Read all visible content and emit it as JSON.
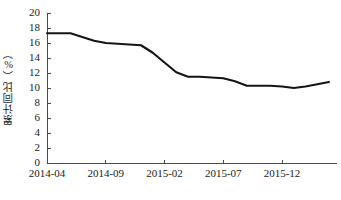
{
  "chart_data": {
    "type": "line",
    "title": "",
    "subtitle": "",
    "xlabel": "",
    "ylabel": "累计同比（%）",
    "ylim": [
      0,
      20
    ],
    "ytick_values": [
      0,
      2,
      4,
      6,
      8,
      10,
      12,
      14,
      16,
      18,
      20
    ],
    "ytick_labels": [
      "0",
      "2",
      "4",
      "6",
      "8",
      "10",
      "12",
      "14",
      "16",
      "18",
      "20"
    ],
    "xtick_labels": [
      "2014-04",
      "2014-09",
      "2015-02",
      "2015-07",
      "2015-12"
    ],
    "xtick_indices": [
      0,
      5,
      10,
      15,
      20
    ],
    "grid": false,
    "legend": false,
    "legend_position": "none",
    "line_color": "#151515",
    "axis_color": "#4a4a4a",
    "background_color": "#ffffff",
    "x": [
      "2014-04",
      "2014-05",
      "2014-06",
      "2014-07",
      "2014-08",
      "2014-09",
      "2014-10",
      "2014-11",
      "2014-12",
      "2015-01",
      "2015-02",
      "2015-03",
      "2015-04",
      "2015-05",
      "2015-06",
      "2015-07",
      "2015-08",
      "2015-09",
      "2015-10",
      "2015-11",
      "2015-12",
      "2016-01",
      "2016-02",
      "2016-03",
      "2016-04"
    ],
    "series": [
      {
        "name": "累计同比",
        "values": [
          17.3,
          17.3,
          17.3,
          16.8,
          16.3,
          16.0,
          15.9,
          15.8,
          15.7,
          14.7,
          13.4,
          12.1,
          11.5,
          11.5,
          11.4,
          11.3,
          10.9,
          10.3,
          10.3,
          10.3,
          10.2,
          10.0,
          10.2,
          10.5,
          10.8
        ]
      }
    ],
    "value_min": 10.0,
    "value_max": 17.3,
    "n_points": 25
  },
  "figure": {
    "name": "累计同比折线图"
  }
}
